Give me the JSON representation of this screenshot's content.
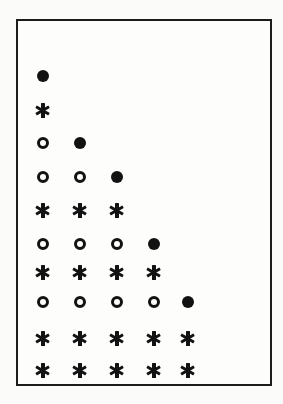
{
  "figure": {
    "title": "",
    "background_color": "#fbfbfa",
    "frame": {
      "border_color": "#1c1c1c",
      "border_width_px": 2,
      "fill_color": "#fdfdfc",
      "left_px": 16,
      "top_px": 19,
      "width_px": 256,
      "height_px": 367
    }
  },
  "legend_keys": {
    "filled-circle": "●",
    "open-circle": "○",
    "asterisk": "✱"
  },
  "chart_data": {
    "type": "scatter",
    "title": "",
    "xlabel": "",
    "ylabel": "",
    "grid": false,
    "legend_position": "none",
    "xlim": [
      0.5,
      5.5
    ],
    "ylim": [
      0.5,
      10.5
    ],
    "x_tick_labels": [
      "1",
      "2",
      "3",
      "4",
      "5"
    ],
    "y_tick_labels": [
      "1",
      "2",
      "3",
      "4",
      "5",
      "6",
      "7",
      "8",
      "9",
      "10"
    ],
    "marker_types": [
      "filled-circle",
      "open-circle",
      "asterisk"
    ],
    "n_rows": 10,
    "n_cols": 5,
    "column_centers_px": [
      41,
      78,
      115,
      152,
      186
    ],
    "row_centers_px": [
      74,
      108,
      141,
      175,
      208,
      242,
      270,
      300,
      336,
      368
    ],
    "rows": [
      {
        "row": 1,
        "markers": [
          "filled-circle"
        ]
      },
      {
        "row": 2,
        "markers": [
          "asterisk"
        ]
      },
      {
        "row": 3,
        "markers": [
          "open-circle",
          "filled-circle"
        ]
      },
      {
        "row": 4,
        "markers": [
          "open-circle",
          "open-circle",
          "filled-circle"
        ]
      },
      {
        "row": 5,
        "markers": [
          "asterisk",
          "asterisk",
          "asterisk"
        ]
      },
      {
        "row": 6,
        "markers": [
          "open-circle",
          "open-circle",
          "open-circle",
          "filled-circle"
        ]
      },
      {
        "row": 7,
        "markers": [
          "asterisk",
          "asterisk",
          "asterisk",
          "asterisk"
        ]
      },
      {
        "row": 8,
        "markers": [
          "open-circle",
          "open-circle",
          "open-circle",
          "open-circle",
          "filled-circle"
        ]
      },
      {
        "row": 9,
        "markers": [
          "asterisk",
          "asterisk",
          "asterisk",
          "asterisk",
          "asterisk"
        ]
      },
      {
        "row": 10,
        "markers": [
          "asterisk",
          "asterisk",
          "asterisk",
          "asterisk",
          "asterisk"
        ]
      }
    ]
  }
}
